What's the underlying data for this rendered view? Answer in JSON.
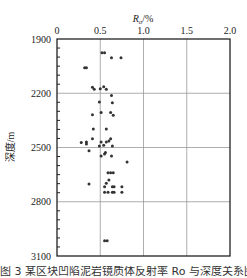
{
  "chart_data": {
    "type": "scatter",
    "title": "",
    "xlabel": "Ro/%",
    "xlabel_main": "R",
    "xlabel_sub": "o",
    "xlabel_suffix": "/%",
    "ylabel": "深度/m",
    "xlim": [
      0,
      2.0
    ],
    "ylim": [
      1900,
      3100
    ],
    "y_inverted": true,
    "x_axis_position": "top",
    "x_ticks": [
      "0",
      "0.5",
      "1.0",
      "1.5",
      "2.0"
    ],
    "y_ticks": [
      "1900",
      "2200",
      "2500",
      "2800",
      "3100"
    ],
    "grid": true,
    "legend": null,
    "marker_color": "#333333",
    "points": [
      {
        "x": 0.52,
        "y": 1976
      },
      {
        "x": 0.55,
        "y": 1976
      },
      {
        "x": 0.63,
        "y": 2003
      },
      {
        "x": 0.74,
        "y": 2003
      },
      {
        "x": 0.32,
        "y": 2059
      },
      {
        "x": 0.34,
        "y": 2059
      },
      {
        "x": 0.41,
        "y": 2167
      },
      {
        "x": 0.43,
        "y": 2178
      },
      {
        "x": 0.5,
        "y": 2175
      },
      {
        "x": 0.54,
        "y": 2164
      },
      {
        "x": 0.57,
        "y": 2178
      },
      {
        "x": 0.63,
        "y": 2212
      },
      {
        "x": 0.49,
        "y": 2248
      },
      {
        "x": 0.64,
        "y": 2252
      },
      {
        "x": 0.41,
        "y": 2319
      },
      {
        "x": 0.51,
        "y": 2306
      },
      {
        "x": 0.62,
        "y": 2306
      },
      {
        "x": 0.65,
        "y": 2322
      },
      {
        "x": 0.42,
        "y": 2398
      },
      {
        "x": 0.57,
        "y": 2398
      },
      {
        "x": 0.41,
        "y": 2451
      },
      {
        "x": 0.51,
        "y": 2470
      },
      {
        "x": 0.57,
        "y": 2470
      },
      {
        "x": 0.6,
        "y": 2464
      },
      {
        "x": 0.62,
        "y": 2451
      },
      {
        "x": 0.28,
        "y": 2473
      },
      {
        "x": 0.34,
        "y": 2470
      },
      {
        "x": 0.34,
        "y": 2481
      },
      {
        "x": 0.49,
        "y": 2492
      },
      {
        "x": 0.54,
        "y": 2488
      },
      {
        "x": 0.64,
        "y": 2492
      },
      {
        "x": 0.37,
        "y": 2518
      },
      {
        "x": 0.56,
        "y": 2527
      },
      {
        "x": 0.55,
        "y": 2536
      },
      {
        "x": 0.51,
        "y": 2547
      },
      {
        "x": 0.63,
        "y": 2547
      },
      {
        "x": 0.81,
        "y": 2580
      },
      {
        "x": 0.59,
        "y": 2639
      },
      {
        "x": 0.62,
        "y": 2639
      },
      {
        "x": 0.65,
        "y": 2639
      },
      {
        "x": 0.6,
        "y": 2680
      },
      {
        "x": 0.37,
        "y": 2702
      },
      {
        "x": 0.57,
        "y": 2698
      },
      {
        "x": 0.55,
        "y": 2717
      },
      {
        "x": 0.64,
        "y": 2717
      },
      {
        "x": 0.66,
        "y": 2717
      },
      {
        "x": 0.75,
        "y": 2717
      },
      {
        "x": 0.55,
        "y": 2748
      },
      {
        "x": 0.59,
        "y": 2748
      },
      {
        "x": 0.64,
        "y": 2748
      },
      {
        "x": 0.66,
        "y": 2748
      },
      {
        "x": 0.75,
        "y": 2748
      },
      {
        "x": 0.55,
        "y": 3015
      },
      {
        "x": 0.58,
        "y": 3015
      }
    ]
  },
  "caption": "图 3  某区块凹陷泥岩镜质体反射率 Ro 与深度关系图"
}
